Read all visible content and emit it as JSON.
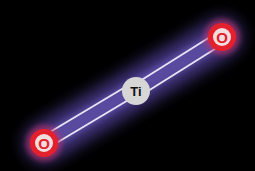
{
  "diagram": {
    "title": "",
    "background": "#000000",
    "atoms": [
      {
        "id": "o1",
        "label": "O",
        "cx": 44,
        "cy": 143,
        "r": 14,
        "color": "#e0202e"
      },
      {
        "id": "ti",
        "label": "Ti",
        "cx": 136,
        "cy": 91,
        "r": 14,
        "color": "#d8d8d8"
      },
      {
        "id": "o2",
        "label": "O",
        "cx": 222,
        "cy": 37,
        "r": 14,
        "color": "#e0202e"
      }
    ],
    "bonds": [
      {
        "from": "o1",
        "to": "ti",
        "order": 2
      },
      {
        "from": "ti",
        "to": "o2",
        "order": 2
      }
    ],
    "glow_color": "#5a4a9a"
  }
}
